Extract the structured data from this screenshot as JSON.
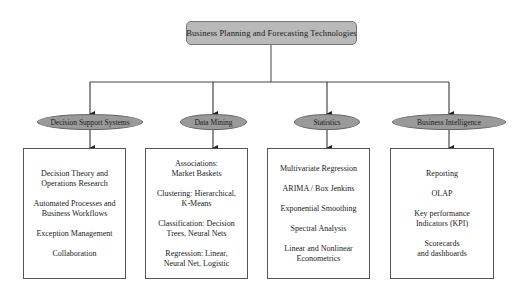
{
  "root": {
    "label": "Business Planning and Forecasting Technologies"
  },
  "categories": [
    {
      "label": "Decision Support Systems",
      "items": [
        "Decision Theory and\nOperations Research",
        "Automated Processes and\nBusiness Workflows",
        "Exception Management",
        "Collaboration"
      ]
    },
    {
      "label": "Data Mining",
      "items": [
        "Associations:\nMarket Baskets",
        "Clustering: Hierarchical,\nK-Means",
        "Classification: Decision\nTrees, Neural Nets",
        "Regression: Linear,\nNeural Net, Logistic"
      ]
    },
    {
      "label": "Statistics",
      "items": [
        "Multivariate Regression",
        "ARIMA / Box Jenkins",
        "Exponential Smoothing",
        "Spectral Analysis",
        "Linear and Nonlinear\nEconometrics"
      ]
    },
    {
      "label": "Business Intelligence",
      "items": [
        "Reporting",
        "OLAP",
        "Key performance\nIndicators (KPI)",
        "Scorecards\nand dashboards"
      ]
    }
  ],
  "colors": {
    "root_fill": "#b9b9b9",
    "ellipse_fill": "#9a9a9a",
    "line": "#333333"
  }
}
